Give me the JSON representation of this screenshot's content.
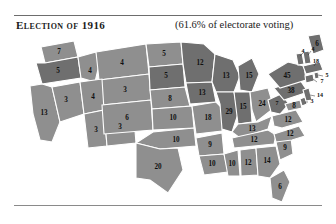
{
  "header": {
    "title": "Election of 1916",
    "turnout_note": "(61.6% of electorate voting)"
  },
  "colors": {
    "wilson_democrat": "#8f8f8f",
    "hughes_republican": "#6f6f6f",
    "border": "#ffffff",
    "rule": "#6d6d6d",
    "text": "#1b1b1b",
    "background": "#ffffff"
  },
  "chart_data": {
    "type": "map",
    "title": "Election of 1916",
    "subtitle": "(61.6% of electorate voting)",
    "unit": "electoral votes",
    "legend_position": "none",
    "shades": {
      "light": "#8f8f8f",
      "dark": "#6f6f6f"
    },
    "categories": [
      "Washington",
      "Oregon",
      "California",
      "Nevada",
      "Idaho",
      "Montana",
      "Wyoming",
      "Utah",
      "Arizona",
      "New Mexico",
      "Colorado",
      "North Dakota",
      "South Dakota",
      "Nebraska",
      "Kansas",
      "Oklahoma",
      "Texas",
      "Minnesota",
      "Iowa",
      "Missouri",
      "Arkansas",
      "Louisiana",
      "Wisconsin",
      "Illinois",
      "Michigan",
      "Indiana",
      "Ohio",
      "Kentucky",
      "Tennessee",
      "Mississippi",
      "Alabama",
      "Georgia",
      "Florida",
      "South Carolina",
      "North Carolina",
      "Virginia",
      "West Virginia",
      "Maryland",
      "Delaware",
      "Pennsylvania",
      "New Jersey",
      "New York",
      "Connecticut",
      "Rhode Island",
      "Massachusetts",
      "Vermont",
      "New Hampshire",
      "Maine"
    ],
    "values": [
      7,
      5,
      13,
      3,
      4,
      4,
      3,
      4,
      3,
      3,
      6,
      5,
      5,
      8,
      10,
      10,
      20,
      12,
      13,
      18,
      9,
      10,
      13,
      29,
      15,
      15,
      24,
      13,
      12,
      10,
      12,
      14,
      6,
      9,
      12,
      12,
      8,
      8,
      3,
      38,
      14,
      45,
      7,
      5,
      18,
      4,
      4,
      6
    ]
  },
  "map": {
    "states": [
      {
        "name": "Washington",
        "abbr": "WA",
        "votes": "7",
        "shade": "light"
      },
      {
        "name": "Oregon",
        "abbr": "OR",
        "votes": "5",
        "shade": "dark"
      },
      {
        "name": "California",
        "abbr": "CA",
        "votes": "13",
        "shade": "light"
      },
      {
        "name": "Nevada",
        "abbr": "NV",
        "votes": "3",
        "shade": "light"
      },
      {
        "name": "Idaho",
        "abbr": "ID",
        "votes": "4",
        "shade": "light"
      },
      {
        "name": "Montana",
        "abbr": "MT",
        "votes": "4",
        "shade": "light"
      },
      {
        "name": "Wyoming",
        "abbr": "WY",
        "votes": "3",
        "shade": "light"
      },
      {
        "name": "Utah",
        "abbr": "UT",
        "votes": "4",
        "shade": "light"
      },
      {
        "name": "Arizona",
        "abbr": "AZ",
        "votes": "3",
        "shade": "light"
      },
      {
        "name": "New Mexico",
        "abbr": "NM",
        "votes": "3",
        "shade": "light"
      },
      {
        "name": "Colorado",
        "abbr": "CO",
        "votes": "6",
        "shade": "light"
      },
      {
        "name": "North Dakota",
        "abbr": "ND",
        "votes": "5",
        "shade": "light"
      },
      {
        "name": "South Dakota",
        "abbr": "SD",
        "votes": "5",
        "shade": "dark"
      },
      {
        "name": "Nebraska",
        "abbr": "NE",
        "votes": "8",
        "shade": "light"
      },
      {
        "name": "Kansas",
        "abbr": "KS",
        "votes": "10",
        "shade": "light"
      },
      {
        "name": "Oklahoma",
        "abbr": "OK",
        "votes": "10",
        "shade": "light"
      },
      {
        "name": "Texas",
        "abbr": "TX",
        "votes": "20",
        "shade": "light"
      },
      {
        "name": "Minnesota",
        "abbr": "MN",
        "votes": "12",
        "shade": "dark"
      },
      {
        "name": "Iowa",
        "abbr": "IA",
        "votes": "13",
        "shade": "dark"
      },
      {
        "name": "Missouri",
        "abbr": "MO",
        "votes": "18",
        "shade": "light"
      },
      {
        "name": "Arkansas",
        "abbr": "AR",
        "votes": "9",
        "shade": "light"
      },
      {
        "name": "Louisiana",
        "abbr": "LA",
        "votes": "10",
        "shade": "light"
      },
      {
        "name": "Wisconsin",
        "abbr": "WI",
        "votes": "13",
        "shade": "dark"
      },
      {
        "name": "Illinois",
        "abbr": "IL",
        "votes": "29",
        "shade": "dark"
      },
      {
        "name": "Michigan",
        "abbr": "MI",
        "votes": "15",
        "shade": "dark"
      },
      {
        "name": "Indiana",
        "abbr": "IN",
        "votes": "15",
        "shade": "dark"
      },
      {
        "name": "Ohio",
        "abbr": "OH",
        "votes": "24",
        "shade": "light"
      },
      {
        "name": "Kentucky",
        "abbr": "KY",
        "votes": "13",
        "shade": "light"
      },
      {
        "name": "Tennessee",
        "abbr": "TN",
        "votes": "12",
        "shade": "light"
      },
      {
        "name": "Mississippi",
        "abbr": "MS",
        "votes": "10",
        "shade": "light"
      },
      {
        "name": "Alabama",
        "abbr": "AL",
        "votes": "12",
        "shade": "light"
      },
      {
        "name": "Georgia",
        "abbr": "GA",
        "votes": "14",
        "shade": "light"
      },
      {
        "name": "Florida",
        "abbr": "FL",
        "votes": "6",
        "shade": "light"
      },
      {
        "name": "South Carolina",
        "abbr": "SC",
        "votes": "9",
        "shade": "light"
      },
      {
        "name": "North Carolina",
        "abbr": "NC",
        "votes": "12",
        "shade": "light"
      },
      {
        "name": "Virginia",
        "abbr": "VA",
        "votes": "12",
        "shade": "light"
      },
      {
        "name": "West Virginia",
        "abbr": "WV",
        "votes": "7",
        "shade": "dark"
      },
      {
        "name": "Maryland",
        "abbr": "MD",
        "votes": "8",
        "shade": "light"
      },
      {
        "name": "Delaware",
        "abbr": "DE",
        "votes": "3",
        "shade": "dark"
      },
      {
        "name": "Pennsylvania",
        "abbr": "PA",
        "votes": "38",
        "shade": "dark"
      },
      {
        "name": "New Jersey",
        "abbr": "NJ",
        "votes": "14",
        "shade": "dark"
      },
      {
        "name": "New York",
        "abbr": "NY",
        "votes": "45",
        "shade": "dark"
      },
      {
        "name": "Connecticut",
        "abbr": "CT",
        "votes": "7",
        "shade": "dark"
      },
      {
        "name": "Rhode Island",
        "abbr": "RI",
        "votes": "5",
        "shade": "dark"
      },
      {
        "name": "Massachusetts",
        "abbr": "MA",
        "votes": "18",
        "shade": "dark"
      },
      {
        "name": "Vermont",
        "abbr": "VT",
        "votes": "4",
        "shade": "dark"
      },
      {
        "name": "New Hampshire",
        "abbr": "NH",
        "votes": "4",
        "shade": "dark"
      },
      {
        "name": "Maine",
        "abbr": "ME",
        "votes": "6",
        "shade": "dark"
      }
    ]
  }
}
